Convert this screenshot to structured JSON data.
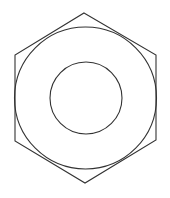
{
  "diagram": {
    "title": "",
    "stroke_color": "#333333",
    "background": "#ffffff",
    "hexagon": {
      "points": [
        [
          84,
          13
        ],
        [
          156,
          55
        ],
        [
          156,
          140
        ],
        [
          85,
          183
        ],
        [
          15,
          141
        ],
        [
          15,
          55
        ]
      ]
    },
    "outer_circle": {
      "cx": 85.5,
      "cy": 98,
      "r": 71
    },
    "inner_circle": {
      "cx": 86,
      "cy": 98,
      "r": 36
    }
  }
}
